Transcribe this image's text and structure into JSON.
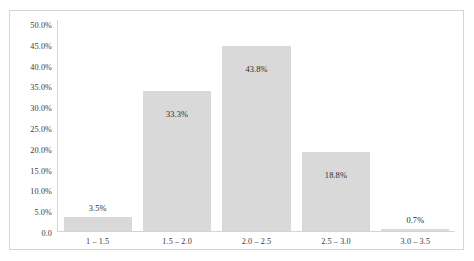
{
  "chart_data": {
    "type": "bar",
    "title": "",
    "subtitle": "",
    "xlabel": "",
    "ylabel": "",
    "categories": [
      "1 – 1.5",
      "1.5 – 2.0",
      "2.0 – 2.5",
      "2.5 – 3.0",
      "3.0 – 3.5"
    ],
    "values": [
      3.5,
      33.3,
      43.8,
      18.8,
      0.7
    ],
    "data_labels": [
      "3.5%",
      "33.3%",
      "43.8%",
      "18.8%",
      "0.7%"
    ],
    "label_placement": [
      "outside",
      "inside",
      "inside",
      "inside",
      "outside"
    ],
    "ylim": [
      0,
      50
    ],
    "ytick_values": [
      50.0,
      45.0,
      40.0,
      35.0,
      30.0,
      25.0,
      20.0,
      15.0,
      10.0,
      5.0,
      0.0
    ],
    "ytick_labels": [
      "50.0%",
      "45.0%",
      "40.0%",
      "35.0%",
      "30.0%",
      "25.0%",
      "20.0%",
      "15.0%",
      "10.0%",
      "5.0%",
      "0.0"
    ],
    "grid": false,
    "legend": false,
    "legend_position": "none",
    "bar_color": "#d9d9d9",
    "axis_color": "#d4d4d4",
    "frame_color": "#d4d4d4",
    "text_color": "#3a3a3a",
    "background": "#ffffff"
  }
}
